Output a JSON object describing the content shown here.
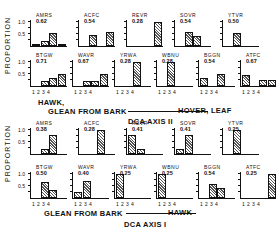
{
  "chart_data": [
    {
      "type": "bar",
      "title": "DCA AXIS II",
      "ylabel": "PROPORTION",
      "xlabel_left": "HAWK, GLEAN FROM BARK",
      "xlabel_right": "HOVER, LEAF",
      "categories": [
        "1",
        "2",
        "3",
        "4"
      ],
      "ylim": [
        0,
        1.0
      ],
      "yticks": [
        "0.5",
        "1.0"
      ],
      "species": [
        {
          "code": "AMRS",
          "score": "0.62",
          "values": [
            0.1,
            0.2,
            0.55,
            0.1
          ]
        },
        {
          "code": "ACFC",
          "score": "0.54",
          "values": [
            0,
            0.45,
            0,
            0.6
          ]
        },
        {
          "code": "REVR",
          "score": "0.28",
          "values": [
            0,
            0,
            0,
            1.0
          ]
        },
        {
          "code": "SOVR",
          "score": "0.54",
          "values": [
            0,
            0.6,
            0.4,
            0
          ]
        },
        {
          "code": "YTVR",
          "score": "0.50",
          "values": [
            0,
            0.55,
            0,
            0
          ]
        },
        {
          "code": "BTGW",
          "score": "0.71",
          "values": [
            0,
            0.2,
            0.35,
            0.5
          ]
        },
        {
          "code": "WAVR",
          "score": "0.67",
          "values": [
            0,
            0.2,
            0.2,
            0.5
          ]
        },
        {
          "code": "YRWA",
          "score": "0.28",
          "values": [
            0,
            0,
            1.0,
            0
          ]
        },
        {
          "code": "WBNU",
          "score": "0.28",
          "values": [
            0,
            1.0,
            0,
            0
          ]
        },
        {
          "code": "BGGN",
          "score": "0.54",
          "values": [
            0.35,
            0,
            0.5,
            0
          ]
        },
        {
          "code": "ATFC",
          "score": "0.67",
          "values": [
            0.45,
            0,
            0.25,
            0.25
          ]
        }
      ]
    },
    {
      "type": "bar",
      "title": "DCA AXIS I",
      "ylabel": "PROPORTION",
      "xlabel_left": "GLEAN FROM BARK",
      "xlabel_right": "HAWK",
      "categories": [
        "1",
        "2",
        "3",
        "4"
      ],
      "ylim": [
        0,
        1.0
      ],
      "yticks": [
        "0.5",
        "1.0"
      ],
      "species": [
        {
          "code": "AMRS",
          "score": "0.38",
          "values": [
            0,
            0.2,
            0.8,
            0
          ]
        },
        {
          "code": "ACFC",
          "score": "0.28",
          "values": [
            0,
            0,
            1.0,
            0
          ]
        },
        {
          "code": "REVR",
          "score": "0.41",
          "values": [
            0.8,
            0.2,
            0,
            0
          ]
        },
        {
          "code": "SOVR",
          "score": "0.41",
          "values": [
            0.2,
            0.8,
            0,
            0
          ]
        },
        {
          "code": "YTVR",
          "score": "0.25",
          "values": [
            0,
            1.0,
            0,
            0
          ]
        },
        {
          "code": "BTGW",
          "score": "0.50",
          "values": [
            0,
            0.65,
            0.35,
            0
          ]
        },
        {
          "code": "WAVR",
          "score": "0.40",
          "values": [
            0.25,
            0.7,
            0,
            0
          ]
        },
        {
          "code": "YRWA",
          "score": "0.25",
          "values": [
            1.0,
            0,
            0,
            0
          ]
        },
        {
          "code": "WBNU",
          "score": "0.25",
          "values": [
            1.0,
            0,
            0,
            0
          ]
        },
        {
          "code": "BGGN",
          "score": "0.54",
          "values": [
            0,
            0.6,
            0.4,
            0
          ]
        },
        {
          "code": "ATFC",
          "score": "0.25",
          "values": [
            0,
            0,
            0,
            1.0
          ]
        }
      ]
    }
  ]
}
